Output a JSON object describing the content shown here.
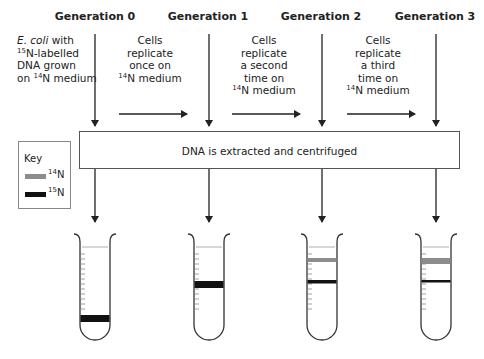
{
  "generations": [
    {
      "label": "Generation 0"
    },
    {
      "label": "Generation 1"
    },
    {
      "label": "Generation 2"
    },
    {
      "label": "Generation 3"
    }
  ],
  "descriptions": {
    "start": {
      "italic": "E. coli",
      "line1_rest": " with",
      "sup1": "15",
      "line2_rest": "N-labelled",
      "line3": "DNA grown",
      "line4_pre": "on ",
      "sup2": "14",
      "line4_rest": "N medium"
    },
    "step1": {
      "lines": [
        "Cells",
        "replicate",
        "once on"
      ],
      "sup": "14",
      "last": "N medium"
    },
    "step2": {
      "lines": [
        "Cells",
        "replicate",
        "a second",
        "time on"
      ],
      "sup": "14",
      "last": "N medium"
    },
    "step3": {
      "lines": [
        "Cells",
        "replicate",
        "a third",
        "time on"
      ],
      "sup": "14",
      "last": "N medium"
    }
  },
  "process_box": {
    "label": "DNA is extracted and centrifuged"
  },
  "key": {
    "title": "Key",
    "items": [
      {
        "sup": "14",
        "label": "N",
        "color": "#8c8c8c"
      },
      {
        "sup": "15",
        "label": "N",
        "color": "#111111"
      }
    ]
  },
  "tubes": [
    {
      "generation": 0,
      "bands": [
        {
          "type": "15N",
          "position": "bottom"
        }
      ]
    },
    {
      "generation": 1,
      "bands": [
        {
          "type": "hybrid",
          "position": "middle"
        }
      ]
    },
    {
      "generation": 2,
      "bands": [
        {
          "type": "14N",
          "position": "top"
        },
        {
          "type": "hybrid",
          "position": "middle"
        }
      ]
    },
    {
      "generation": 3,
      "bands": [
        {
          "type": "14N",
          "position": "top"
        },
        {
          "type": "hybrid",
          "position": "middle"
        }
      ]
    }
  ],
  "colors": {
    "light_band": "#8c8c8c",
    "heavy_band": "#111111",
    "line": "#222222"
  }
}
